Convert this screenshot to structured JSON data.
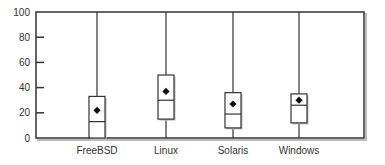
{
  "chart_data": {
    "type": "boxplot",
    "title": "",
    "xlabel": "",
    "ylabel": "",
    "ylim": [
      0,
      100
    ],
    "yticks": [
      0,
      20,
      40,
      60,
      80,
      100
    ],
    "grid": false,
    "legend": null,
    "categories": [
      "FreeBSD",
      "Linux",
      "Solaris",
      "Windows"
    ],
    "series": [
      {
        "name": "FreeBSD",
        "whisker_low": 0,
        "q1": 0,
        "median": 13,
        "q3": 33,
        "whisker_high": 100,
        "mean": 22
      },
      {
        "name": "Linux",
        "whisker_low": 0,
        "q1": 15,
        "median": 30,
        "q3": 50,
        "whisker_high": 100,
        "mean": 37
      },
      {
        "name": "Solaris",
        "whisker_low": 0,
        "q1": 8,
        "median": 19,
        "q3": 36,
        "whisker_high": 100,
        "mean": 27
      },
      {
        "name": "Windows",
        "whisker_low": 0,
        "q1": 12,
        "median": 26,
        "q3": 35,
        "whisker_high": 100,
        "mean": 30
      }
    ]
  },
  "colors": {
    "frame": "#333333",
    "box_fill": "#ffffff",
    "shadow": "#bbbbbb",
    "mean_marker": "#111111"
  }
}
